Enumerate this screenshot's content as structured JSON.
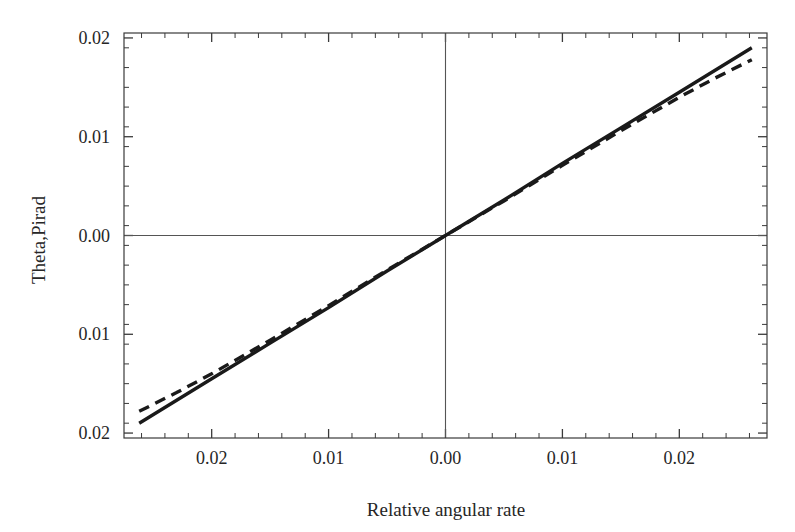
{
  "chart_data": {
    "type": "line",
    "title": "",
    "xlabel": "Relative angular rate",
    "ylabel": "Theta,Pirad",
    "xlim": [
      -0.0275,
      0.0275
    ],
    "ylim": [
      -0.0205,
      0.0205
    ],
    "grid": false,
    "legend": "none",
    "x_tick_labels": [
      "0.02",
      "0.01",
      "0.00",
      "0.01",
      "0.02"
    ],
    "x_tick_values": [
      -0.02,
      -0.01,
      0.0,
      0.01,
      0.02
    ],
    "y_tick_labels": [
      "0.02",
      "0.01",
      "0.00",
      "0.01",
      "0.02"
    ],
    "y_tick_values": [
      0.02,
      0.01,
      0.0,
      -0.01,
      -0.02
    ],
    "x_minor_per_major": 5,
    "y_minor_per_major": 5,
    "zero_lines": {
      "horizontal": 0.0,
      "vertical": 0.0
    },
    "series": [
      {
        "name": "solid",
        "style": "solid",
        "color": "#1a1a1a",
        "width": 3.4,
        "x": [
          -0.0262,
          -0.02,
          -0.015,
          -0.01,
          -0.005,
          0.0,
          0.005,
          0.01,
          0.015,
          0.02,
          0.0262
        ],
        "y": [
          -0.019,
          -0.0145,
          -0.0109,
          -0.0073,
          -0.0036,
          0.0,
          0.0036,
          0.0073,
          0.0109,
          0.0145,
          0.019
        ]
      },
      {
        "name": "dashed",
        "style": "dashed",
        "color": "#1a1a1a",
        "width": 3.4,
        "dash_pattern": "11 7",
        "x": [
          -0.0262,
          -0.023,
          -0.02,
          -0.015,
          -0.01,
          -0.005,
          0.0,
          0.005,
          0.01,
          0.015,
          0.02,
          0.023,
          0.0262
        ],
        "y": [
          -0.0178,
          -0.0159,
          -0.014,
          -0.0106,
          -0.0071,
          -0.0035,
          0.0,
          0.0035,
          0.0071,
          0.0106,
          0.014,
          0.0159,
          0.0178
        ]
      }
    ],
    "frame": {
      "color": "#3a3a3a",
      "width": 1.2
    }
  }
}
